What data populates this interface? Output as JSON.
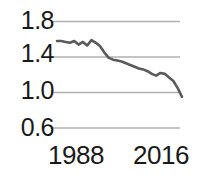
{
  "chart_data": {
    "type": "line",
    "title": "",
    "subtitle": "",
    "xlabel": "",
    "ylabel": "",
    "xlim": [
      1986,
      2017
    ],
    "ylim": [
      0.6,
      1.8
    ],
    "grid": true,
    "grid_axis": "y",
    "legend": "none",
    "line_color": "#5a5a5a",
    "grid_color": "#b0b0b0",
    "text_color": "#1a1a1a",
    "background": "#ffffff",
    "y_ticks": [
      "1.8",
      "1.4",
      "1.0",
      "0.6"
    ],
    "y_tick_values": [
      1.8,
      1.4,
      1.0,
      0.6
    ],
    "x_ticks": [
      "1988",
      "2016"
    ],
    "x_tick_values": [
      1988,
      2016
    ],
    "x": [
      1987,
      1988,
      1989,
      1990,
      1991,
      1992,
      1993,
      1994,
      1995,
      1996,
      1997,
      1998,
      1999,
      2000,
      2001,
      2002,
      2003,
      2004,
      2005,
      2006,
      2007,
      2008,
      2009,
      2010,
      2011,
      2012,
      2013,
      2014,
      2015,
      2016
    ],
    "values": [
      1.58,
      1.58,
      1.57,
      1.56,
      1.58,
      1.54,
      1.57,
      1.53,
      1.59,
      1.56,
      1.52,
      1.45,
      1.39,
      1.37,
      1.36,
      1.35,
      1.33,
      1.31,
      1.29,
      1.27,
      1.26,
      1.24,
      1.21,
      1.19,
      1.22,
      1.21,
      1.17,
      1.13,
      1.05,
      0.95
    ],
    "series": [
      {
        "name": "series-1",
        "values": [
          1.58,
          1.58,
          1.57,
          1.56,
          1.58,
          1.54,
          1.57,
          1.53,
          1.59,
          1.56,
          1.52,
          1.45,
          1.39,
          1.37,
          1.36,
          1.35,
          1.33,
          1.31,
          1.29,
          1.27,
          1.26,
          1.24,
          1.21,
          1.19,
          1.22,
          1.21,
          1.17,
          1.13,
          1.05,
          0.95
        ]
      }
    ]
  }
}
